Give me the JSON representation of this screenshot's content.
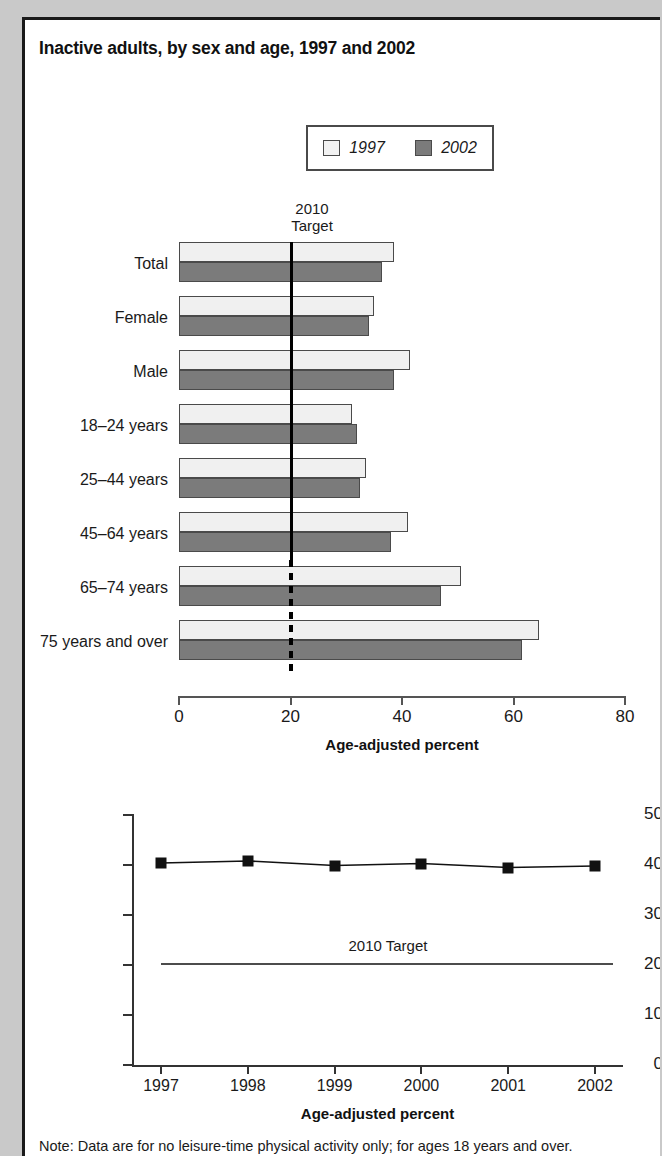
{
  "figure": {
    "title": "Inactive adults, by sex and age, 1997 and 2002",
    "note": "Note: Data are for no leisure-time physical activity only; for ages 18 years and over."
  },
  "legend": {
    "entries": [
      {
        "label": "1997",
        "swatch": "light",
        "color": "#f2f2f2"
      },
      {
        "label": "2002",
        "swatch": "dark",
        "color": "#7b7b7b"
      }
    ]
  },
  "target_caption_line1": "2010",
  "target_caption_line2": "Target",
  "chart_data": [
    {
      "type": "bar",
      "orientation": "horizontal",
      "title": "Inactive adults, by sex and age, 1997 and 2002",
      "xlabel": "Age-adjusted percent",
      "ylabel": "",
      "xlim": [
        0,
        80
      ],
      "xticks": [
        0,
        20,
        40,
        60,
        80
      ],
      "grid": false,
      "legend_position": "top",
      "categories": [
        "Total",
        "Female",
        "Male",
        "18–24 years",
        "25–44 years",
        "45–64 years",
        "65–74 years",
        "75 years and over"
      ],
      "series": [
        {
          "name": "1997",
          "values": [
            38.5,
            35.0,
            41.5,
            31.0,
            33.5,
            41.0,
            50.5,
            64.5
          ]
        },
        {
          "name": "2002",
          "values": [
            36.5,
            34.0,
            38.5,
            32.0,
            32.5,
            38.0,
            47.0,
            61.5
          ]
        }
      ],
      "annotations": [
        {
          "text": "2010 Target",
          "value": 20,
          "style": "vertical-reference-line"
        }
      ]
    },
    {
      "type": "line",
      "title": "",
      "xlabel": "Age-adjusted percent",
      "ylabel": "",
      "ylim": [
        0,
        50
      ],
      "yticks": [
        0,
        10,
        20,
        30,
        40,
        50
      ],
      "x": [
        "1997",
        "1998",
        "1999",
        "2000",
        "2001",
        "2002"
      ],
      "grid": false,
      "series": [
        {
          "name": "Inactive adults",
          "values": [
            40.2,
            40.6,
            39.7,
            40.1,
            39.3,
            39.6
          ],
          "marker": "square"
        }
      ],
      "annotations": [
        {
          "text": "2010 Target",
          "value": 20,
          "style": "horizontal-reference-line"
        }
      ]
    }
  ]
}
